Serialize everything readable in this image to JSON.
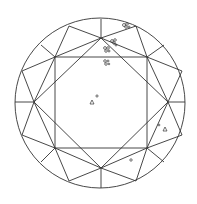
{
  "diagram": {
    "type": "diamond-clarity-plot",
    "view": "crown",
    "colors": {
      "line": "#333333",
      "background": "#ffffff"
    },
    "girdle": {
      "cx": 100,
      "cy": 103,
      "r": 85
    },
    "table": [
      [
        55,
        57
      ],
      [
        147,
        57
      ],
      [
        147,
        148
      ],
      [
        55,
        148
      ]
    ],
    "star_points": [
      [
        101,
        38
      ],
      [
        168,
        102
      ],
      [
        101,
        168
      ],
      [
        34,
        102
      ]
    ],
    "girdle_points": [
      [
        69,
        26
      ],
      [
        136,
        26
      ],
      [
        164,
        45
      ],
      [
        182,
        71
      ],
      [
        182,
        135
      ],
      [
        164,
        162
      ],
      [
        136,
        181
      ],
      [
        69,
        181
      ],
      [
        41,
        162
      ],
      [
        22,
        135
      ],
      [
        22,
        71
      ],
      [
        41,
        45
      ],
      [
        101,
        19
      ],
      [
        185,
        102
      ],
      [
        101,
        188
      ],
      [
        15,
        102
      ]
    ],
    "inclusions": [
      {
        "type": "crystal-cluster",
        "x": 126,
        "y": 26
      },
      {
        "type": "crystal-cluster",
        "x": 114,
        "y": 42
      },
      {
        "type": "crystal-cluster",
        "x": 107,
        "y": 49
      },
      {
        "type": "crystal-cluster",
        "x": 107,
        "y": 62
      },
      {
        "type": "crystal",
        "x": 92,
        "y": 102
      },
      {
        "type": "pinpoint",
        "x": 97,
        "y": 97
      },
      {
        "type": "pinpoint",
        "x": 159,
        "y": 125
      },
      {
        "type": "crystal",
        "x": 165,
        "y": 129
      },
      {
        "type": "crystal",
        "x": 131,
        "y": 160
      }
    ]
  }
}
